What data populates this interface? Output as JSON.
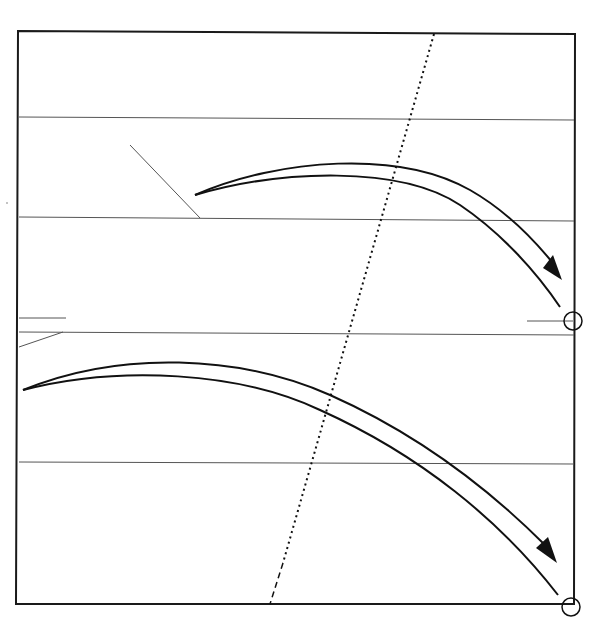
{
  "diagram": {
    "colors": {
      "background": "#ffffff",
      "frame": "#1a1a1a",
      "guide_lines": "#555555",
      "arrows": "#111111",
      "dotted_line": "#111111"
    },
    "elements": {
      "frame": "rectangular-frame",
      "horizontal_lines": 4,
      "dotted_line": "slanted-dotted-line",
      "arrows": [
        "upper-curved-arrow",
        "lower-curved-arrow"
      ],
      "markers": [
        "circle-marker-right-middle",
        "circle-marker-bottom-right"
      ],
      "leader_lines": [
        "upper-diagonal-leader",
        "left-short-line",
        "left-diagonal-leader",
        "right-short-line"
      ]
    }
  }
}
